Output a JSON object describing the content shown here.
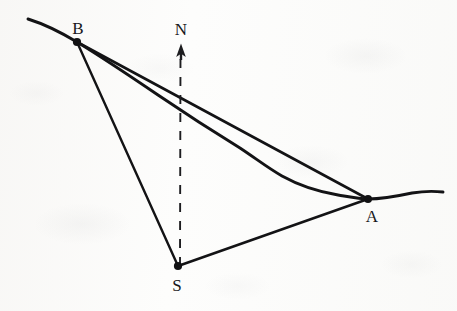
{
  "figure": {
    "kind": "surveying-bearing-diagram",
    "stroke_color": "#131315",
    "paper_color": "#fdfdfc",
    "labels": {
      "station_b": "B",
      "station_a": "A",
      "station_s": "S",
      "north": "N"
    },
    "points": [
      {
        "name": "B",
        "label": "B",
        "x": 77,
        "y": 42,
        "label_x": 78,
        "label_y": 28
      },
      {
        "name": "A",
        "label": "A",
        "x": 368,
        "y": 199,
        "label_x": 372,
        "label_y": 216
      },
      {
        "name": "S",
        "label": "S",
        "x": 178,
        "y": 266,
        "label_x": 177,
        "label_y": 285
      }
    ],
    "north_arrow": {
      "label": "N",
      "label_x": 181,
      "label_y": 29,
      "tip_x": 181,
      "tip_y": 44,
      "base_x": 180,
      "base_y": 266,
      "style": "dashed"
    },
    "segments": [
      {
        "name": "line-b-a",
        "from": "B",
        "to": "A",
        "style": "solid"
      },
      {
        "name": "line-b-s",
        "from": "B",
        "to": "S",
        "style": "solid"
      },
      {
        "name": "line-s-a",
        "from": "S",
        "to": "A",
        "style": "solid"
      }
    ],
    "coastline": {
      "name": "coastline-curve",
      "style": "solid-wavy",
      "description": "irregular shoreline entering at left edge, passing through B, bowing below line BA, meeting A, continuing to right edge",
      "path": "M 28 19 C 44 24 62 33 77 42 C 100 56 130 76 158 95 C 186 114 214 132 240 148 C 266 164 298 182 330 192 C 346 197 358 199 368 199 C 384 199 398 196 412 193 C 424 191 434 191 443 192"
    }
  }
}
